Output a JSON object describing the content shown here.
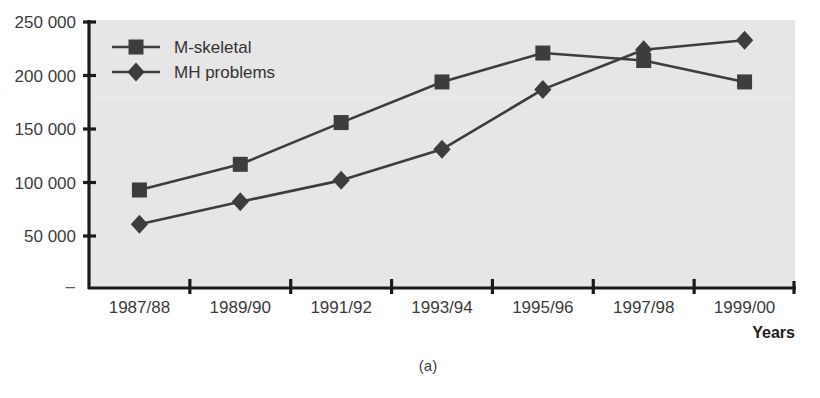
{
  "figure": {
    "caption": "(a)",
    "background_color": "#ffffff",
    "plot_background_color": "#e6e6e6",
    "axis_color": "#1a1a1a",
    "series_color": "#3d3d3d"
  },
  "chart_data": {
    "type": "line",
    "title": "",
    "subtitle": "",
    "xlabel": "Years",
    "ylabel": "",
    "categories": [
      "1987/88",
      "1989/90",
      "1991/92",
      "1993/94",
      "1995/96",
      "1997/98",
      "1999/00"
    ],
    "series": [
      {
        "name": "M-skeletal",
        "marker": "square",
        "values": [
          93000,
          117000,
          156000,
          194000,
          221000,
          214000,
          194000
        ]
      },
      {
        "name": "MH problems",
        "marker": "diamond",
        "values": [
          61000,
          82000,
          102000,
          131000,
          187000,
          224000,
          233000
        ]
      }
    ],
    "ylim": [
      0,
      250000
    ],
    "ytick_values": [
      50000,
      100000,
      150000,
      200000,
      250000
    ],
    "ytick_labels": [
      "50 000",
      "100 000",
      "150 000",
      "200 000",
      "250 000"
    ],
    "zero_tick_label": "–",
    "grid": false,
    "legend_position": "top-left",
    "legend_entries": [
      "M-skeletal",
      "MH problems"
    ]
  }
}
